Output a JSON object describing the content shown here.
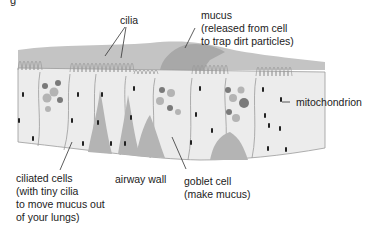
{
  "diagram": {
    "title_fragment": "g",
    "colors": {
      "background": "#ffffff",
      "cell_fill": "#ececec",
      "cell_outline": "#9a9a9a",
      "mucus": "#b8b8b8",
      "mucus_dark": "#a6a6a6",
      "wall_fill": "#b0b0b0",
      "granule_dark": "#7a7a7a",
      "granule_light": "#b4b4b4",
      "mitochondrion": "#222222",
      "leader_line": "#333333",
      "text": "#222222"
    },
    "labels": {
      "cilia": "cilia",
      "mucus": {
        "line1": "mucus",
        "line2": "(released from cell",
        "line3": "to trap dirt particles)"
      },
      "mitochondrion": "mitochondrion",
      "ciliated_cells": {
        "line1": "ciliated cells",
        "line2": "(with tiny cilia",
        "line3": "to move mucus out",
        "line4": "of your lungs)"
      },
      "airway_wall": "airway wall",
      "goblet_cell": {
        "line1": "goblet cell",
        "line2": "(make mucus)"
      }
    }
  }
}
